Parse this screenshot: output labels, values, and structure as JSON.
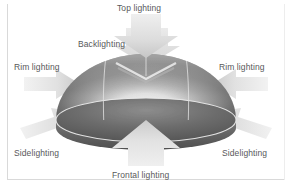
{
  "figure": {
    "palette": {
      "background": "#ffffff",
      "frame": "#d9d9d9",
      "label_text": "#58585a",
      "arrow_light": "#e8e8e8",
      "arrow_mid": "#cfcfcf",
      "arrow_shadow": "#bdbdbd",
      "dome_dark": "#4a4a4a",
      "dome_mid": "#8c8c8c",
      "dome_light": "#e3e3e3",
      "dome_base_dark": "#5e5e5e",
      "meridian_line": "#e6e6e6"
    }
  },
  "labels": {
    "top": "Top lighting",
    "backlighting": "Backlighting",
    "rim_left": "Rim lighting",
    "rim_right": "Rim lighting",
    "sidelighting_left": "Sidelighting",
    "sidelighting_right": "Sidelighting",
    "frontal": "Frontal lighting"
  },
  "arrows": [
    {
      "name": "top-lighting-arrow",
      "direction": "down",
      "label": "Top lighting"
    },
    {
      "name": "backlighting-arrow",
      "direction": "down-front",
      "label": "Backlighting"
    },
    {
      "name": "rim-lighting-left-arrow",
      "direction": "right",
      "label": "Rim lighting"
    },
    {
      "name": "rim-lighting-right-arrow",
      "direction": "left",
      "label": "Rim lighting"
    },
    {
      "name": "sidelighting-left-arrow",
      "direction": "up-right",
      "label": "Sidelighting"
    },
    {
      "name": "sidelighting-right-arrow",
      "direction": "up-left",
      "label": "Sidelighting"
    },
    {
      "name": "frontal-lighting-arrow",
      "direction": "up",
      "label": "Frontal lighting"
    }
  ]
}
